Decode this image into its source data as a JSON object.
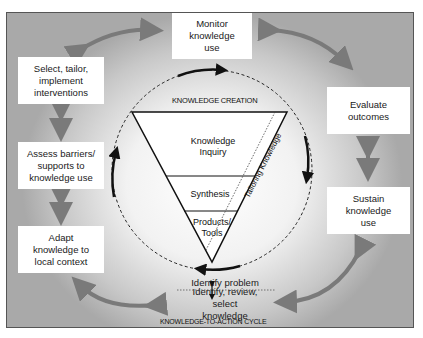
{
  "diagram": {
    "title_top": "KNOWLEDGE CREATION",
    "title_bottom": "KNOWLEDGE-TO-ACTION CYCLE",
    "funnel": {
      "sections": [
        "Knowledge Inquiry",
        "Synthesis",
        "Products/ Tools"
      ],
      "side_label": "Tailoring Knowledge"
    },
    "cycle_boxes": {
      "monitor": "Monitor knowledge use",
      "evaluate": "Evaluate outcomes",
      "sustain": "Sustain knowledge use",
      "select": "Select, tailor, implement interventions",
      "assess": "Assess barriers/ supports to knowledge use",
      "adapt": "Adapt knowledge to local context",
      "identify_problem": "Identify problem",
      "identify_review": "Identify, review, select knowledge"
    },
    "colors": {
      "arrow_gray": "#7a7a7a",
      "line_black": "#111111",
      "box_white": "#ffffff",
      "frame_border": "#555555"
    }
  }
}
